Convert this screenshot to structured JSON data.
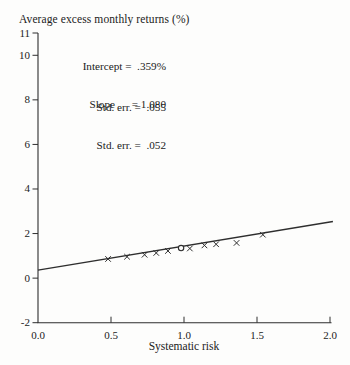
{
  "colors": {
    "ink": "#2e2e2e",
    "text": "#222222",
    "background": "#fdfdfc"
  },
  "annotations": {
    "intercept_line": "Intercept =  .359%",
    "intercept_stderr_line": "Std. err. =  .055",
    "slope_line": "Slope      = 1.080",
    "slope_stderr_line": "Std. err. =  .052"
  },
  "chart_data": {
    "type": "scatter",
    "title": "Average excess monthly returns (%)",
    "xlabel": "Systematic risk",
    "ylabel": "Average excess monthly returns (%)",
    "xlim": [
      0.0,
      2.0
    ],
    "ylim": [
      -2,
      11
    ],
    "grid": false,
    "legend_position": "none",
    "xticks": [
      0.5,
      1.0,
      1.5,
      2.0
    ],
    "xtick_labels": [
      {
        "v": 0.0,
        "label": "0.0"
      },
      {
        "v": 0.5,
        "label": "0.5"
      },
      {
        "v": 1.0,
        "label": "1.0"
      },
      {
        "v": 1.5,
        "label": "1.5"
      },
      {
        "v": 2.0,
        "label": "2.0"
      }
    ],
    "yticks": [
      {
        "v": 11,
        "label": "11"
      },
      {
        "v": 10,
        "label": "10"
      },
      {
        "v": 8,
        "label": "8"
      },
      {
        "v": 6,
        "label": "6"
      },
      {
        "v": 4,
        "label": "4"
      },
      {
        "v": 2,
        "label": "2"
      },
      {
        "v": 0,
        "label": "0"
      },
      {
        "v": -2,
        "label": "-2"
      }
    ],
    "fit": {
      "intercept": 0.359,
      "intercept_label": ".359%",
      "intercept_stderr": 0.055,
      "slope": 1.08,
      "slope_stderr": 0.052,
      "x_range": [
        0.0,
        2.02
      ]
    },
    "points": [
      {
        "x": 0.48,
        "y": 0.86,
        "marker": "x"
      },
      {
        "x": 0.61,
        "y": 0.96,
        "marker": "x"
      },
      {
        "x": 0.73,
        "y": 1.05,
        "marker": "x"
      },
      {
        "x": 0.81,
        "y": 1.13,
        "marker": "x"
      },
      {
        "x": 0.89,
        "y": 1.22,
        "marker": "x"
      },
      {
        "x": 0.98,
        "y": 1.35,
        "marker": "o"
      },
      {
        "x": 1.04,
        "y": 1.33,
        "marker": "x"
      },
      {
        "x": 1.14,
        "y": 1.47,
        "marker": "x"
      },
      {
        "x": 1.22,
        "y": 1.52,
        "marker": "x"
      },
      {
        "x": 1.36,
        "y": 1.58,
        "marker": "x"
      },
      {
        "x": 1.54,
        "y": 1.95,
        "marker": "x"
      }
    ]
  }
}
